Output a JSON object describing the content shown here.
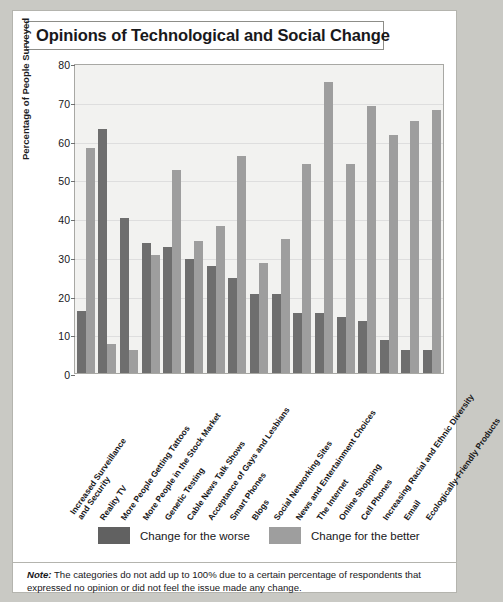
{
  "title": "Opinions of Technological and Social Change",
  "legend": [
    {
      "label": "Change for the worse",
      "color": "#616161"
    },
    {
      "label": "Change for the better",
      "color": "#9e9e9e"
    }
  ],
  "note": {
    "prefix": "Note:",
    "text": " The categories do not add up to 100% due to a certain percentage of respondents that expressed no opinion or did not feel the issue made any change."
  },
  "chart_data": {
    "type": "bar",
    "title": "Opinions of Technological and Social Change",
    "xlabel": "",
    "ylabel": "Percentage of People Surveyed",
    "ylim": [
      0,
      80
    ],
    "yticks": [
      0,
      10,
      20,
      30,
      40,
      50,
      60,
      70,
      80
    ],
    "grid": true,
    "legend_position": "bottom",
    "categories": [
      "Increased Surveillance and Security",
      "Reality TV",
      "More People Getting Tattoos",
      "More People in the Stock Market",
      "Genetic Testing",
      "Cable News Talk Shows",
      "Acceptance of Gays and Lesbians",
      "Smart Phones",
      "Blogs",
      "Social Networking Sites",
      "News and Entertainment Choices",
      "The Internet",
      "Online Shopping",
      "Cell Phones",
      "Increasing Racial and Ethnic Diversity",
      "Email",
      "Ecologically-Friendly Products"
    ],
    "category_lines": [
      [
        "Increased Surveillance",
        "and Security"
      ],
      [
        "Reality TV"
      ],
      [
        "More People Getting Tattoos"
      ],
      [
        "More People in the Stock Market"
      ],
      [
        "Genetic Testing"
      ],
      [
        "Cable News Talk Shows"
      ],
      [
        "Acceptance of Gays and Lesbians"
      ],
      [
        "Smart Phones"
      ],
      [
        "Blogs"
      ],
      [
        "Social Networking Sites"
      ],
      [
        "News and Entertainment Choices"
      ],
      [
        "The Internet"
      ],
      [
        "Online Shopping"
      ],
      [
        "Cell Phones"
      ],
      [
        "Increasing Racial and Ethnic Diversity"
      ],
      [
        "Email"
      ],
      [
        "Ecologically-Friendly Products"
      ]
    ],
    "series": [
      {
        "name": "Change for the worse",
        "color": "#6e6e6e",
        "values": [
          16,
          63,
          40,
          33.5,
          32.5,
          29.5,
          27.5,
          24.5,
          20.5,
          20.5,
          15.5,
          15.5,
          14.5,
          13.5,
          8.5,
          6,
          6
        ]
      },
      {
        "name": "Change for the better",
        "color": "#9e9e9e",
        "values": [
          58,
          7.5,
          6,
          30.5,
          52.5,
          34,
          38,
          56,
          28.5,
          34.5,
          54,
          75,
          54,
          69,
          61.5,
          65,
          68
        ]
      }
    ]
  }
}
